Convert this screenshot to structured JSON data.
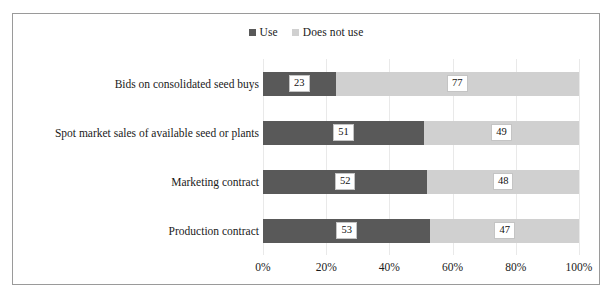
{
  "chart_data": {
    "type": "bar",
    "orientation": "horizontal",
    "stacked": true,
    "stack_mode": "percent",
    "title": "",
    "subtitle": "",
    "xlabel": "",
    "ylabel": "",
    "xlim": [
      0,
      100
    ],
    "xticks": [
      0,
      20,
      40,
      60,
      80,
      100
    ],
    "xticklabels": [
      "0%",
      "20%",
      "40%",
      "60%",
      "80%",
      "100%"
    ],
    "grid": "vertical",
    "legend_position": "top-center",
    "categories": [
      "Bids on consolidated seed buys",
      "Spot market sales of available seed or plants",
      "Marketing contract",
      "Production contract"
    ],
    "series": [
      {
        "name": "Use",
        "color": "#595959",
        "values": [
          23,
          51,
          52,
          53
        ]
      },
      {
        "name": "Does not use",
        "color": "#d0d0d0",
        "values": [
          77,
          49,
          48,
          47
        ]
      }
    ],
    "data_labels": [
      [
        "23",
        "77"
      ],
      [
        "51",
        "49"
      ],
      [
        "52",
        "48"
      ],
      [
        "53",
        "47"
      ]
    ]
  },
  "legend": {
    "items": [
      {
        "label": "Use",
        "color": "#595959"
      },
      {
        "label": "Does not use",
        "color": "#d0d0d0"
      }
    ]
  },
  "colors": {
    "use": "#595959",
    "does_not_use": "#d0d0d0",
    "frame_border": "#9a9a9a",
    "gridline": "#e9e9e9",
    "background": "#ffffff",
    "text": "#1a1a1a"
  }
}
